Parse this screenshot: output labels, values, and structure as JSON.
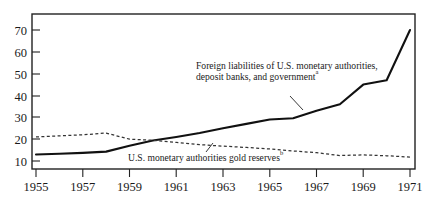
{
  "chart_data": {
    "type": "line",
    "title": "",
    "subtitle": "",
    "xlabel": "",
    "ylabel": "",
    "xlim": [
      1955,
      1971
    ],
    "ylim": [
      4,
      74
    ],
    "grid": false,
    "legend_position": "inline-annotations",
    "xticks": [
      1955,
      1957,
      1959,
      1961,
      1963,
      1965,
      1967,
      1969,
      1971
    ],
    "xtick_labels": [
      "1955",
      "1957",
      "1959",
      "1961",
      "1963",
      "1965",
      "1967",
      "1969",
      "1971"
    ],
    "yticks": [
      10,
      20,
      30,
      40,
      50,
      60,
      70
    ],
    "ytick_labels": [
      "10",
      "20",
      "30",
      "40",
      "50",
      "60",
      "70"
    ],
    "series": [
      {
        "name": "Foreign liabilities of U.S. monetary authorities, deposit banks, and government",
        "style": "solid",
        "color": "#111111",
        "x": [
          1955,
          1956,
          1957,
          1958,
          1959,
          1960,
          1961,
          1962,
          1963,
          1964,
          1965,
          1966,
          1967,
          1968,
          1969,
          1970,
          1971
        ],
        "values": [
          13.0,
          13.3,
          13.7,
          14.3,
          17.0,
          19.4,
          21.0,
          22.8,
          25.0,
          27.0,
          29.0,
          29.6,
          33.0,
          36.0,
          45.0,
          47.0,
          70.0
        ]
      },
      {
        "name": "U.S. monetary authorities gold reserves",
        "style": "dashed",
        "color": "#333333",
        "x": [
          1955,
          1956,
          1957,
          1958,
          1959,
          1960,
          1961,
          1962,
          1963,
          1964,
          1965,
          1966,
          1967,
          1968,
          1969,
          1970,
          1971
        ],
        "values": [
          21.0,
          21.5,
          22.0,
          22.8,
          20.0,
          19.5,
          18.5,
          17.5,
          16.8,
          16.2,
          15.5,
          14.6,
          13.8,
          12.5,
          12.8,
          12.4,
          11.8
        ]
      }
    ],
    "annotations": [
      {
        "id": "liabilities-annotation",
        "line1": "Foreign liabilities of U.S. monetary authorities,",
        "line2": "deposit banks, and government",
        "superscript": "a",
        "leader": true
      },
      {
        "id": "gold-reserves-annotation",
        "line1": "U.S. monetary authorities gold reserves",
        "line2": "",
        "superscript": "b",
        "leader": true
      }
    ]
  },
  "figure": {
    "frame_color": "#222222",
    "background_color": "#ffffff"
  }
}
